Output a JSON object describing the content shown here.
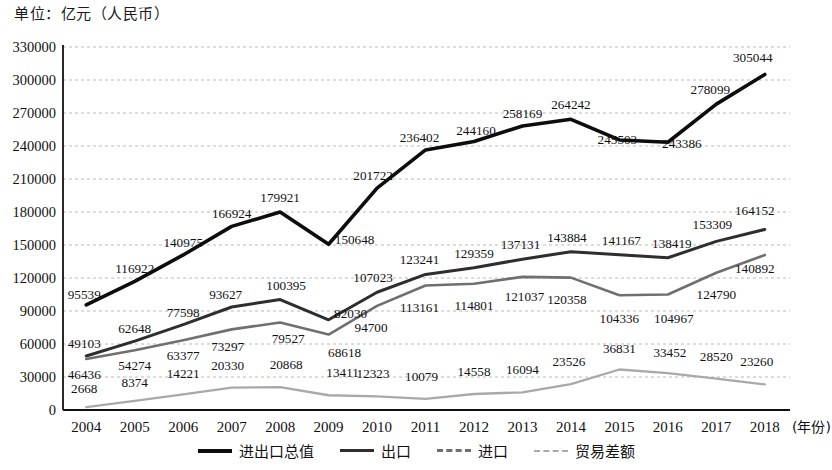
{
  "unit_label": "单位：亿元（人民币）",
  "axis": {
    "x_name": "(年份)",
    "y_ticks": [
      "330000",
      "300000",
      "270000",
      "240000",
      "210000",
      "180000",
      "150000",
      "120000",
      "90000",
      "60000",
      "30000",
      "0"
    ]
  },
  "legend": {
    "items": [
      {
        "label": "进出口总值",
        "key": "total",
        "color": "#0d0d0d",
        "style": "solid"
      },
      {
        "label": "出口",
        "key": "export",
        "color": "#2e2e2e",
        "style": "solid"
      },
      {
        "label": "进口",
        "key": "import",
        "color": "#6f6f6f",
        "style": "dashed"
      },
      {
        "label": "贸易差额",
        "key": "balance",
        "color": "#a9a9a9",
        "style": "dashed"
      }
    ]
  },
  "chart_data": {
    "type": "line",
    "title": "",
    "subtitle": "",
    "xlabel": "(年份)",
    "ylabel": "单位：亿元（人民币）",
    "ylim": [
      0,
      330000
    ],
    "ytick_step": 30000,
    "grid": true,
    "legend_position": "bottom",
    "categories": [
      "2004",
      "2005",
      "2006",
      "2007",
      "2008",
      "2009",
      "2010",
      "2011",
      "2012",
      "2013",
      "2014",
      "2015",
      "2016",
      "2017",
      "2018"
    ],
    "series": [
      {
        "name": "进出口总值",
        "color": "#0d0d0d",
        "values": [
          95539,
          116922,
          140975,
          166924,
          179921,
          150648,
          201722,
          236402,
          244160,
          258169,
          264242,
          245503,
          243386,
          278099,
          305044
        ]
      },
      {
        "name": "出口",
        "color": "#2e2e2e",
        "values": [
          49103,
          62648,
          77598,
          93627,
          100395,
          82030,
          107023,
          123241,
          129359,
          137131,
          143884,
          141167,
          138419,
          153309,
          164152
        ]
      },
      {
        "name": "进口",
        "color": "#6f6f6f",
        "values": [
          46436,
          54274,
          63377,
          73297,
          79527,
          68618,
          94700,
          113161,
          114801,
          121037,
          120358,
          104336,
          104967,
          124790,
          140892
        ]
      },
      {
        "name": "贸易差额",
        "color": "#a9a9a9",
        "values": [
          2668,
          8374,
          14221,
          20330,
          20868,
          13411,
          12323,
          10079,
          14558,
          16094,
          23526,
          36831,
          33452,
          28520,
          23260
        ]
      }
    ]
  }
}
